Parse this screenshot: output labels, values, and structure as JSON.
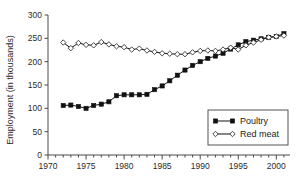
{
  "chart_data": {
    "type": "line",
    "title": "",
    "xlabel": "",
    "ylabel": "Employment (in thousands)",
    "xlim": [
      1970,
      2001.8
    ],
    "ylim": [
      0,
      300
    ],
    "yticks": [
      0,
      50,
      100,
      150,
      200,
      250,
      300
    ],
    "xticks": [
      1970,
      1975,
      1980,
      1985,
      1990,
      1995,
      2000
    ],
    "xticklabels": [
      "1970",
      "1975",
      "1980",
      "1985",
      "1990",
      "1995",
      "2000"
    ],
    "yticklabels": [
      "0",
      "50",
      "100",
      "150",
      "200",
      "250",
      "300"
    ],
    "xminor_step": 1,
    "grid": false,
    "legend_position": "lower-right",
    "x": [
      1972,
      1973,
      1974,
      1975,
      1976,
      1977,
      1978,
      1979,
      1980,
      1981,
      1982,
      1983,
      1984,
      1985,
      1986,
      1987,
      1988,
      1989,
      1990,
      1991,
      1992,
      1993,
      1994,
      1995,
      1996,
      1997,
      1998,
      1999,
      2000,
      2001
    ],
    "series": [
      {
        "name": "Poultry",
        "marker": "filled-square",
        "values": [
          106,
          107,
          104,
          100,
          106,
          109,
          114,
          127,
          129,
          129,
          129,
          130,
          140,
          148,
          159,
          171,
          182,
          192,
          200,
          207,
          212,
          218,
          227,
          236,
          243,
          246,
          249,
          252,
          254,
          260
        ]
      },
      {
        "name": "Red meat",
        "marker": "open-diamond",
        "values": [
          241,
          229,
          240,
          236,
          235,
          242,
          237,
          233,
          231,
          226,
          228,
          224,
          221,
          218,
          217,
          216,
          216,
          220,
          223,
          224,
          223,
          226,
          230,
          226,
          235,
          241,
          247,
          252,
          254,
          256
        ]
      }
    ]
  },
  "legend": {
    "items": [
      {
        "label": "Poultry",
        "marker": "filled-square"
      },
      {
        "label": "Red meat",
        "marker": "open-diamond"
      }
    ]
  }
}
